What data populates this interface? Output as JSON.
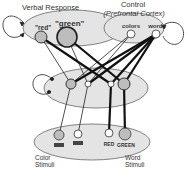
{
  "layers": {
    "verbal_response": {
      "label": "Verbal Response",
      "units": [
        "\"red\"",
        "\"green\""
      ]
    },
    "control": {
      "label_line1": "Control",
      "label_line2": "(Prefrontal Cortex)",
      "units": [
        "colors",
        "words"
      ]
    },
    "hidden": {
      "units": [
        "hidden-color-red",
        "hidden-color-green",
        "hidden-word-red",
        "hidden-word-green"
      ]
    },
    "stimuli": {
      "color_label_line1": "Color",
      "color_label_line2": "Stimuli",
      "word_label_line1": "Word",
      "word_label_line2": "Stimuli",
      "word_units": [
        "RED",
        "GREEN"
      ]
    }
  },
  "colors": {
    "layer_fill": "#e4e4e4",
    "active_unit_fill": "#bdbdbd",
    "inactive_unit_fill": "#ffffff",
    "line": "#111111"
  }
}
